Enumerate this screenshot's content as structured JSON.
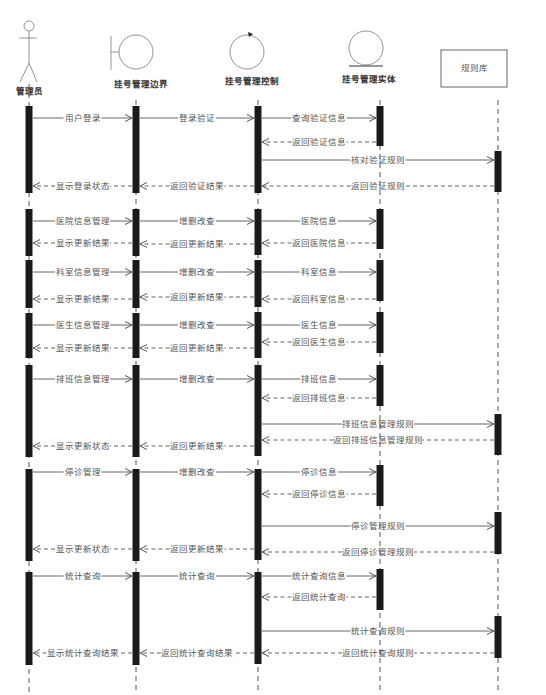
{
  "diagram": {
    "type": "sequence",
    "participants": [
      {
        "id": "admin",
        "label": "管理员",
        "kind": "actor",
        "x": 29
      },
      {
        "id": "boundary",
        "label": "挂号管理边界",
        "kind": "boundary",
        "x": 136
      },
      {
        "id": "control",
        "label": "挂号管理控制",
        "kind": "control",
        "x": 258
      },
      {
        "id": "entity",
        "label": "挂号管理实体",
        "kind": "entity",
        "x": 380
      },
      {
        "id": "rules",
        "label": "规则库",
        "kind": "box",
        "x": 498
      }
    ],
    "activations": [
      {
        "p": "admin",
        "y1": 106,
        "y2": 193
      },
      {
        "p": "boundary",
        "y1": 106,
        "y2": 193
      },
      {
        "p": "control",
        "y1": 106,
        "y2": 193
      },
      {
        "p": "entity",
        "y1": 106,
        "y2": 146
      },
      {
        "p": "rules",
        "y1": 151,
        "y2": 192
      },
      {
        "p": "admin",
        "y1": 209,
        "y2": 256
      },
      {
        "p": "boundary",
        "y1": 209,
        "y2": 256
      },
      {
        "p": "control",
        "y1": 209,
        "y2": 255
      },
      {
        "p": "entity",
        "y1": 209,
        "y2": 249
      },
      {
        "p": "admin",
        "y1": 260,
        "y2": 308
      },
      {
        "p": "boundary",
        "y1": 260,
        "y2": 308
      },
      {
        "p": "control",
        "y1": 260,
        "y2": 307
      },
      {
        "p": "entity",
        "y1": 260,
        "y2": 301
      },
      {
        "p": "admin",
        "y1": 313,
        "y2": 358
      },
      {
        "p": "boundary",
        "y1": 313,
        "y2": 358
      },
      {
        "p": "control",
        "y1": 312,
        "y2": 358
      },
      {
        "p": "entity",
        "y1": 312,
        "y2": 353
      },
      {
        "p": "admin",
        "y1": 365,
        "y2": 457
      },
      {
        "p": "boundary",
        "y1": 365,
        "y2": 457
      },
      {
        "p": "control",
        "y1": 365,
        "y2": 456
      },
      {
        "p": "entity",
        "y1": 365,
        "y2": 406
      },
      {
        "p": "rules",
        "y1": 414,
        "y2": 455
      },
      {
        "p": "admin",
        "y1": 469,
        "y2": 561
      },
      {
        "p": "boundary",
        "y1": 469,
        "y2": 561
      },
      {
        "p": "control",
        "y1": 469,
        "y2": 560
      },
      {
        "p": "entity",
        "y1": 465,
        "y2": 506
      },
      {
        "p": "rules",
        "y1": 512,
        "y2": 554
      },
      {
        "p": "admin",
        "y1": 572,
        "y2": 665
      },
      {
        "p": "boundary",
        "y1": 572,
        "y2": 665
      },
      {
        "p": "control",
        "y1": 572,
        "y2": 664
      },
      {
        "p": "entity",
        "y1": 569,
        "y2": 610
      },
      {
        "p": "rules",
        "y1": 616,
        "y2": 658
      }
    ],
    "messages": [
      {
        "from": "admin",
        "to": "boundary",
        "y": 118,
        "label": "用户登录",
        "kind": "call"
      },
      {
        "from": "boundary",
        "to": "control",
        "y": 118,
        "label": "登录验证",
        "kind": "call"
      },
      {
        "from": "control",
        "to": "entity",
        "y": 118,
        "label": "查询验证信息",
        "kind": "call"
      },
      {
        "from": "entity",
        "to": "control",
        "y": 142,
        "label": "返回验证信息",
        "kind": "return"
      },
      {
        "from": "control",
        "to": "rules",
        "y": 160,
        "label": "核对验证规则",
        "kind": "call"
      },
      {
        "from": "rules",
        "to": "control",
        "y": 186,
        "label": "返回验证规则",
        "kind": "return"
      },
      {
        "from": "control",
        "to": "boundary",
        "y": 186,
        "label": "返回验证结果",
        "kind": "return"
      },
      {
        "from": "boundary",
        "to": "admin",
        "y": 186,
        "label": "显示登录状态",
        "kind": "return"
      },
      {
        "from": "admin",
        "to": "boundary",
        "y": 221,
        "label": "医院信息管理",
        "kind": "call"
      },
      {
        "from": "boundary",
        "to": "control",
        "y": 221,
        "label": "增删改查",
        "kind": "call"
      },
      {
        "from": "control",
        "to": "entity",
        "y": 221,
        "label": "医院信息",
        "kind": "call"
      },
      {
        "from": "entity",
        "to": "control",
        "y": 243,
        "label": "返回医院信息",
        "kind": "return"
      },
      {
        "from": "control",
        "to": "boundary",
        "y": 244,
        "label": "返回更新结果",
        "kind": "return"
      },
      {
        "from": "boundary",
        "to": "admin",
        "y": 243,
        "label": "显示更新结果",
        "kind": "return"
      },
      {
        "from": "admin",
        "to": "boundary",
        "y": 272,
        "label": "科室信息管理",
        "kind": "call"
      },
      {
        "from": "boundary",
        "to": "control",
        "y": 272,
        "label": "增删改查",
        "kind": "call"
      },
      {
        "from": "control",
        "to": "entity",
        "y": 272,
        "label": "科室信息",
        "kind": "call"
      },
      {
        "from": "entity",
        "to": "control",
        "y": 299,
        "label": "返回科室信息",
        "kind": "return"
      },
      {
        "from": "control",
        "to": "boundary",
        "y": 297,
        "label": "返回更新结果",
        "kind": "return"
      },
      {
        "from": "boundary",
        "to": "admin",
        "y": 299,
        "label": "显示更新结果",
        "kind": "return"
      },
      {
        "from": "admin",
        "to": "boundary",
        "y": 325,
        "label": "医生信息管理",
        "kind": "call"
      },
      {
        "from": "boundary",
        "to": "control",
        "y": 325,
        "label": "增删改查",
        "kind": "call"
      },
      {
        "from": "control",
        "to": "entity",
        "y": 325,
        "label": "医生信息",
        "kind": "call"
      },
      {
        "from": "entity",
        "to": "control",
        "y": 342,
        "label": "返回医生信息",
        "kind": "return"
      },
      {
        "from": "control",
        "to": "boundary",
        "y": 348,
        "label": "返回更新结果",
        "kind": "return"
      },
      {
        "from": "boundary",
        "to": "admin",
        "y": 348,
        "label": "显示更新结果",
        "kind": "return"
      },
      {
        "from": "admin",
        "to": "boundary",
        "y": 379,
        "label": "排班信息管理",
        "kind": "call"
      },
      {
        "from": "boundary",
        "to": "control",
        "y": 379,
        "label": "增删改查",
        "kind": "call"
      },
      {
        "from": "control",
        "to": "entity",
        "y": 379,
        "label": "排班信息",
        "kind": "call"
      },
      {
        "from": "entity",
        "to": "control",
        "y": 398,
        "label": "返回排班信息",
        "kind": "return"
      },
      {
        "from": "control",
        "to": "rules",
        "y": 424,
        "label": "排班信息管理规则",
        "kind": "call"
      },
      {
        "from": "rules",
        "to": "control",
        "y": 440,
        "label": "返回排班信息管理规则",
        "kind": "return"
      },
      {
        "from": "control",
        "to": "boundary",
        "y": 446,
        "label": "返回更新结果",
        "kind": "return"
      },
      {
        "from": "boundary",
        "to": "admin",
        "y": 446,
        "label": "显示更新状态",
        "kind": "return"
      },
      {
        "from": "admin",
        "to": "boundary",
        "y": 472,
        "label": "停诊管理",
        "kind": "call"
      },
      {
        "from": "boundary",
        "to": "control",
        "y": 472,
        "label": "增删改查",
        "kind": "call"
      },
      {
        "from": "control",
        "to": "entity",
        "y": 472,
        "label": "停诊信息",
        "kind": "call"
      },
      {
        "from": "entity",
        "to": "control",
        "y": 494,
        "label": "返回停诊信息",
        "kind": "return"
      },
      {
        "from": "control",
        "to": "rules",
        "y": 526,
        "label": "停诊管理规则",
        "kind": "call"
      },
      {
        "from": "rules",
        "to": "control",
        "y": 552,
        "label": "返回停诊管理规则",
        "kind": "return"
      },
      {
        "from": "control",
        "to": "boundary",
        "y": 549,
        "label": "返回更新结果",
        "kind": "return"
      },
      {
        "from": "boundary",
        "to": "admin",
        "y": 549,
        "label": "显示更新状态",
        "kind": "return"
      },
      {
        "from": "admin",
        "to": "boundary",
        "y": 576,
        "label": "统计查询",
        "kind": "call"
      },
      {
        "from": "boundary",
        "to": "control",
        "y": 576,
        "label": "统计查询",
        "kind": "call"
      },
      {
        "from": "control",
        "to": "entity",
        "y": 576,
        "label": "统计查询信息",
        "kind": "call"
      },
      {
        "from": "entity",
        "to": "control",
        "y": 597,
        "label": "返回统计查询",
        "kind": "return"
      },
      {
        "from": "control",
        "to": "rules",
        "y": 631,
        "label": "统计查询规则",
        "kind": "call"
      },
      {
        "from": "rules",
        "to": "control",
        "y": 653,
        "label": "返回统计查询规则",
        "kind": "return"
      },
      {
        "from": "control",
        "to": "boundary",
        "y": 653,
        "label": "返回统计查询结果",
        "kind": "return"
      },
      {
        "from": "boundary",
        "to": "admin",
        "y": 653,
        "label": "显示统计查询结果",
        "kind": "return"
      }
    ]
  }
}
